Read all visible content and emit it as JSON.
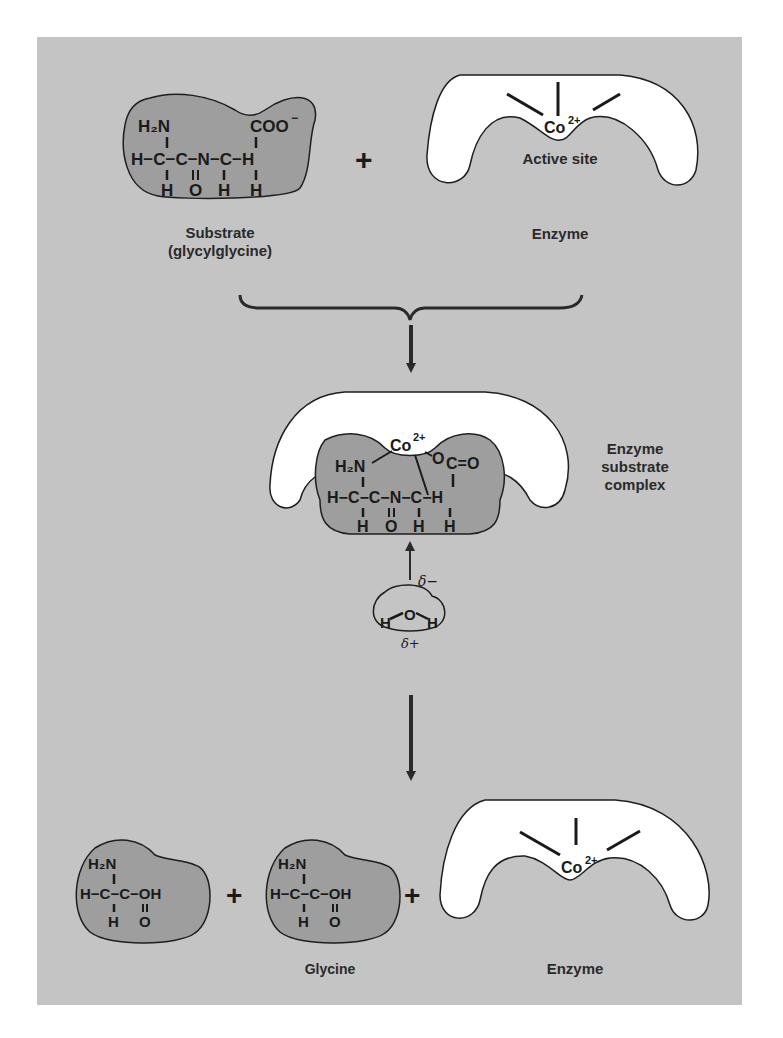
{
  "colors": {
    "background": "#ffffff",
    "panel": "#c4c4c4",
    "molecule_fill": "#9e9e9e",
    "enzyme_fill": "#ffffff",
    "outline": "#1e1e1e",
    "text": "#2a2a2a"
  },
  "reactants": {
    "substrate": {
      "label_line1": "Substrate",
      "label_line2": "(glycylglycine)",
      "atoms": {
        "h2n": "H₂N",
        "coo": "COO",
        "coo_charge": "−",
        "backbone": "H−C−C−N−C−H",
        "bottom": [
          "H",
          "O",
          "H",
          "H"
        ]
      }
    },
    "plus": "+",
    "enzyme": {
      "label": "Enzyme",
      "active_site_label": "Active site",
      "cofactor": "Co",
      "cofactor_charge": "2+"
    }
  },
  "complex": {
    "label_line1": "Enzyme",
    "label_line2": "substrate",
    "label_line3": "complex",
    "cofactor": "Co",
    "cofactor_charge": "2+",
    "atoms": {
      "h2n": "H₂N",
      "oco": "O",
      "c_eq_o": "C=O",
      "backbone": "H−C−C−N−C−H",
      "bottom": [
        "H",
        "O",
        "H",
        "H"
      ]
    }
  },
  "water": {
    "o": "O",
    "h_left": "H",
    "h_right": "H",
    "delta_minus": "δ−",
    "delta_plus": "δ+"
  },
  "products": {
    "glycine_1": {
      "h2n": "H₂N",
      "backbone": "H−C−C−OH",
      "bottom": [
        "H",
        "O"
      ]
    },
    "plus_1": "+",
    "glycine_2": {
      "h2n": "H₂N",
      "backbone": "H−C−C−OH",
      "bottom": [
        "H",
        "O"
      ]
    },
    "plus_2": "+",
    "glycine_label": "Glycine",
    "enzyme": {
      "label": "Enzyme",
      "cofactor": "Co",
      "cofactor_charge": "2+"
    }
  }
}
